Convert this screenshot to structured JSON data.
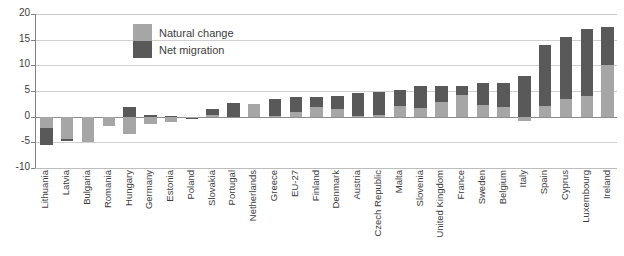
{
  "chart_data": {
    "type": "bar",
    "title": "",
    "xlabel": "",
    "ylabel": "",
    "ylim": [
      -10,
      20
    ],
    "yticks": [
      20,
      15,
      10,
      5,
      0,
      -5,
      -10
    ],
    "grid": true,
    "stacked": true,
    "legend_position": "inside-top-left",
    "legend": [
      "Natural change",
      "Net migration"
    ],
    "colors": {
      "natural_change": "#a6a6a6",
      "net_migration": "#595959",
      "gridline": "#d0d0d0",
      "axis": "#808080",
      "text": "#3d3d3d",
      "background": "#ffffff"
    },
    "categories": [
      "Lithuania",
      "Latvia",
      "Bulgaria",
      "Romania",
      "Hungary",
      "Germany",
      "Estonia",
      "Poland",
      "Slovakia",
      "Portugal",
      "Netherlands",
      "Greece",
      "EU-27",
      "Finland",
      "Denmark",
      "Austria",
      "Czech Republic",
      "Malta",
      "Slovenia",
      "United Kingdom",
      "France",
      "Sweden",
      "Belgium",
      "Italy",
      "Spain",
      "Cyprus",
      "Luxembourg",
      "Ireland"
    ],
    "series": [
      {
        "name": "Natural change",
        "values": [
          -2.3,
          -4.4,
          -5.0,
          -1.8,
          -3.4,
          -1.5,
          -1.0,
          -0.2,
          0.3,
          0.0,
          2.5,
          0.2,
          1.0,
          1.9,
          1.5,
          0.2,
          0.3,
          2.0,
          1.6,
          2.9,
          4.2,
          2.2,
          1.8,
          -0.8,
          2.1,
          3.4,
          4.0,
          10.0
        ]
      },
      {
        "name": "Net migration",
        "values": [
          -3.2,
          -0.4,
          0.0,
          0.0,
          1.8,
          0.3,
          0.1,
          -0.1,
          1.1,
          2.6,
          0.0,
          3.3,
          2.8,
          2.0,
          2.6,
          4.4,
          4.5,
          3.2,
          4.4,
          3.1,
          1.8,
          4.3,
          4.8,
          7.9,
          11.9,
          12.1,
          13.0,
          7.5
        ]
      }
    ],
    "totals": [
      -5.5,
      -4.8,
      -5.0,
      -1.8,
      -1.6,
      -1.2,
      -0.9,
      -0.3,
      1.4,
      2.6,
      2.5,
      3.5,
      3.8,
      3.9,
      4.1,
      4.6,
      4.8,
      5.2,
      6.0,
      6.0,
      6.0,
      6.5,
      6.6,
      7.1,
      14.0,
      15.5,
      17.0,
      17.5
    ]
  },
  "axis": {
    "y_tick_labels": [
      "20",
      "15",
      "10",
      "5",
      "0",
      "-5",
      "-10"
    ]
  },
  "legend": {
    "items": [
      {
        "label": "Natural change",
        "key": "natural"
      },
      {
        "label": "Net migration",
        "key": "migration"
      }
    ]
  }
}
